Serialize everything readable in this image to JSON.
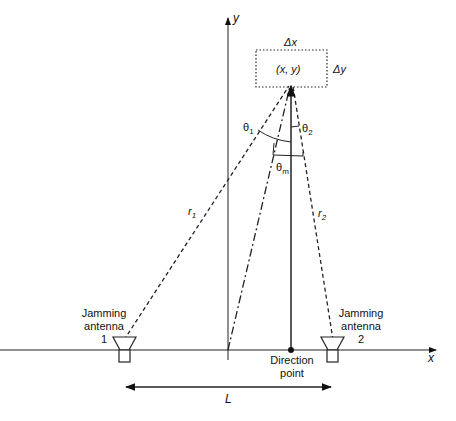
{
  "axes": {
    "x_label": "x",
    "y_label": "y"
  },
  "target": {
    "label": "(x, y)",
    "dx_label": "Δx",
    "dy_label": "Δy"
  },
  "angles": {
    "theta1": "θ",
    "theta1_sub": "1",
    "theta2": "θ",
    "theta2_sub": "2",
    "thetam": "θ",
    "thetam_sub": "m"
  },
  "ranges": {
    "r1": "r",
    "r1_sub": "1",
    "r2": "r",
    "r2_sub": "2"
  },
  "antenna1": {
    "line1": "Jamming",
    "line2": "antenna",
    "line3": "1"
  },
  "antenna2": {
    "line1": "Jamming",
    "line2": "antenna",
    "line3": "2"
  },
  "direction_point": {
    "line1": "Direction",
    "line2": "point"
  },
  "baseline": {
    "label": "L"
  }
}
